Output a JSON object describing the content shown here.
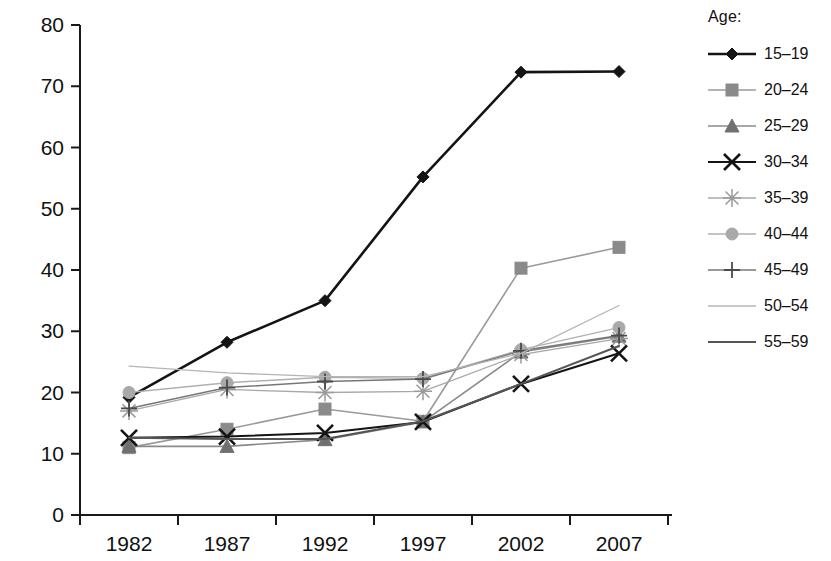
{
  "chart_data": {
    "type": "line",
    "title": "",
    "xlabel": "",
    "ylabel": "",
    "categories": [
      "1982",
      "1987",
      "1992",
      "1997",
      "2002",
      "2007"
    ],
    "ylim": [
      0,
      80
    ],
    "yticks": [
      0,
      10,
      20,
      30,
      40,
      50,
      60,
      70,
      80
    ],
    "grid": false,
    "legend_position": "right",
    "legend_title": "Age:",
    "series": [
      {
        "name": "15–19",
        "marker": "diamond",
        "color": "#141414",
        "line_color": "#141414",
        "line_width": 2.6,
        "values": [
          19.2,
          28.2,
          35.0,
          55.2,
          72.3,
          72.4
        ]
      },
      {
        "name": "20–24",
        "marker": "square",
        "color": "#8a8a8a",
        "line_color": "#9a9a9a",
        "line_width": 1.6,
        "values": [
          11.0,
          14.0,
          17.3,
          15.3,
          40.3,
          43.7
        ]
      },
      {
        "name": "25–29",
        "marker": "triangle",
        "color": "#707070",
        "line_color": "#8a8a8a",
        "line_width": 1.6,
        "values": [
          11.2,
          11.2,
          12.3,
          15.2,
          26.6,
          29.2
        ]
      },
      {
        "name": "30–34",
        "marker": "x",
        "color": "#141414",
        "line_color": "#141414",
        "line_width": 2.0,
        "values": [
          12.6,
          12.8,
          13.4,
          15.2,
          21.4,
          26.4
        ]
      },
      {
        "name": "35–39",
        "marker": "asterisk",
        "color": "#9b9b9b",
        "line_color": "#a8a8a8",
        "line_width": 1.3,
        "values": [
          17.0,
          20.5,
          20.0,
          20.2,
          26.2,
          28.8
        ]
      },
      {
        "name": "40–44",
        "marker": "circle",
        "color": "#a9a9a9",
        "line_color": "#b0b0b0",
        "line_width": 1.4,
        "values": [
          20.0,
          21.6,
          22.5,
          22.3,
          27.0,
          30.6
        ]
      },
      {
        "name": "45–49",
        "marker": "plus",
        "color": "#4a4a4a",
        "line_color": "#777777",
        "line_width": 1.5,
        "values": [
          17.4,
          20.8,
          21.8,
          22.2,
          26.8,
          29.3
        ]
      },
      {
        "name": "50–54",
        "marker": "none",
        "color": "#b4b4b4",
        "line_color": "#b4b4b4",
        "line_width": 1.3,
        "values": [
          24.3,
          23.2,
          22.6,
          22.6,
          26.4,
          34.2
        ]
      },
      {
        "name": "55–59",
        "marker": "none",
        "color": "#555555",
        "line_color": "#555555",
        "line_width": 2.0,
        "values": [
          12.6,
          12.4,
          12.4,
          15.3,
          21.4,
          27.6
        ]
      }
    ]
  },
  "axes": {
    "y_tick_labels": [
      "80",
      "70",
      "60",
      "50",
      "40",
      "30",
      "20",
      "10",
      "0"
    ],
    "x_tick_labels": [
      "1982",
      "1987",
      "1992",
      "1997",
      "2002",
      "2007"
    ]
  }
}
